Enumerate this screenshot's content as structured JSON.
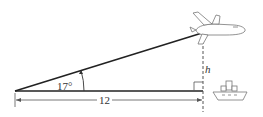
{
  "diagram": {
    "angle_label": "17°",
    "height_label": "h",
    "distance_label": "12",
    "objects": [
      "airplane-icon",
      "ship-icon"
    ],
    "colors": {
      "line": "#222222",
      "dashed": "#555555",
      "icon_stroke": "#777777"
    }
  }
}
